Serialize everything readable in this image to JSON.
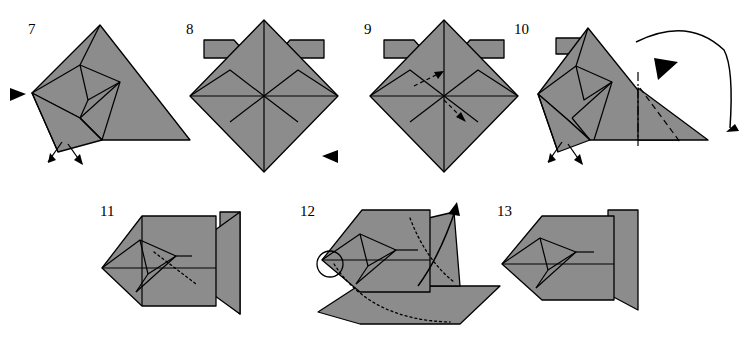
{
  "diagram": {
    "background_color": "#ffffff",
    "paper_fill": "#8c8c8c",
    "paper_fill_light": "#9a9a9a",
    "line_color": "#000000",
    "steps": [
      {
        "number": "7",
        "label_x": 28,
        "label_y": 22,
        "annotations": [
          "black-triangle-arrowhead-left",
          "double-headed-fold-arrow"
        ]
      },
      {
        "number": "8",
        "label_x": 186,
        "label_y": 22,
        "annotations": [
          "black-triangle-arrowhead-right"
        ]
      },
      {
        "number": "9",
        "label_x": 364,
        "label_y": 22,
        "annotations": [
          "two-dashed-push-arrows"
        ]
      },
      {
        "number": "10",
        "label_x": 514,
        "label_y": 22,
        "annotations": [
          "curved-fold-over-arrow",
          "black-triangle-arrowhead",
          "dash-dot-crease-line",
          "dashed-valley-fold-line",
          "double-headed-fold-arrow"
        ]
      },
      {
        "number": "11",
        "label_x": 100,
        "label_y": 204,
        "annotations": [
          "dotted-hidden-edge"
        ]
      },
      {
        "number": "12",
        "label_x": 300,
        "label_y": 204,
        "annotations": [
          "circle-highlight",
          "curved-pull-arrow",
          "dotted-hidden-edges"
        ]
      },
      {
        "number": "13",
        "label_x": 497,
        "label_y": 204,
        "annotations": []
      }
    ]
  }
}
